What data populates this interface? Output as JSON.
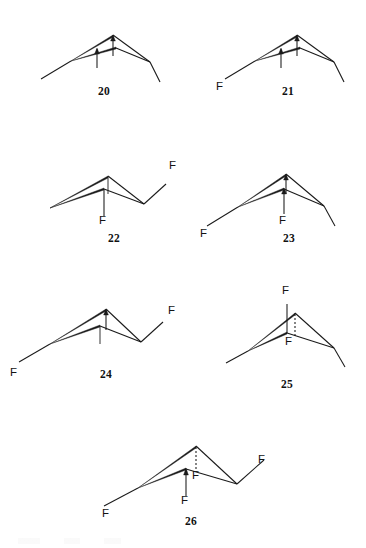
{
  "figure": {
    "type": "chemical-structure-diagram",
    "atom_symbol": "F",
    "line_color": "#1a1a1a",
    "background": "#ffffff"
  },
  "structures": [
    {
      "id": "20",
      "number": "20",
      "fluorine_count": 0,
      "labels": [],
      "features": [
        "apex-methyl",
        "second-apex-methyl",
        "left-arm",
        "right-arm"
      ]
    },
    {
      "id": "21",
      "number": "21",
      "fluorine_count": 1,
      "labels": [
        "F"
      ],
      "features": [
        "apex-methyl",
        "second-apex-methyl",
        "left-terminal-fluorine",
        "right-arm"
      ]
    },
    {
      "id": "22",
      "number": "22",
      "fluorine_count": 2,
      "labels": [
        "F",
        "F"
      ],
      "features": [
        "apex-methyl",
        "second-apex-fluoromethyl",
        "left-arm",
        "right-terminal-fluorine"
      ]
    },
    {
      "id": "23",
      "number": "23",
      "fluorine_count": 2,
      "labels": [
        "F",
        "F"
      ],
      "features": [
        "apex-methyl",
        "second-apex-fluoromethyl",
        "left-terminal-fluorine",
        "right-arm"
      ]
    },
    {
      "id": "24",
      "number": "24",
      "fluorine_count": 2,
      "labels": [
        "F",
        "F"
      ],
      "features": [
        "apex-methyl",
        "second-apex-methyl",
        "left-terminal-fluorine",
        "right-terminal-fluorine"
      ]
    },
    {
      "id": "25",
      "number": "25",
      "fluorine_count": 2,
      "labels": [
        "F",
        "F"
      ],
      "features": [
        "apex-dashed-fluorine",
        "second-apex-fluoromethyl",
        "left-arm",
        "right-arm"
      ]
    },
    {
      "id": "26",
      "number": "26",
      "fluorine_count": 4,
      "labels": [
        "F",
        "F",
        "F",
        "F"
      ],
      "features": [
        "apex-dashed-fluorine",
        "second-apex-fluoromethyl",
        "left-terminal-fluorine",
        "right-terminal-fluorine"
      ]
    }
  ]
}
